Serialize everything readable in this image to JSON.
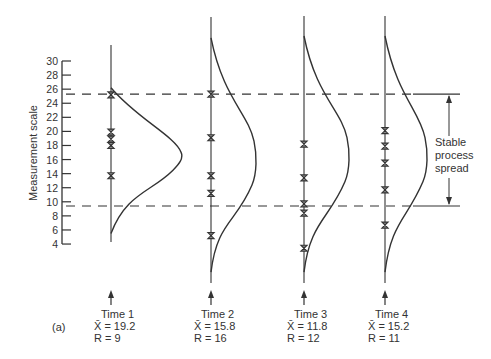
{
  "figure": {
    "panel_label": "(a)",
    "y_axis_title": "Measurement scale",
    "annotation": [
      "Stable",
      "process",
      "spread"
    ],
    "colors": {
      "ink": "#333333",
      "background": "#ffffff"
    }
  },
  "chart_data": {
    "type": "scatter",
    "title": "",
    "xlabel": "",
    "ylabel": "Measurement scale",
    "ylim": [
      4,
      30
    ],
    "yticks": [
      4,
      6,
      8,
      10,
      12,
      14,
      16,
      18,
      20,
      22,
      24,
      26,
      28,
      30
    ],
    "control_limits": {
      "upper": 25.3,
      "lower": 9.4,
      "label": "Stable process spread"
    },
    "categories": [
      "Time 1",
      "Time 2",
      "Time 3",
      "Time 4"
    ],
    "series": [
      {
        "name": "Time 1",
        "xbar_label": "X̄ = 19.2",
        "r_label": "R = 9",
        "xbar": 19.2,
        "range": 9,
        "points": [
          25.2,
          19.9,
          18.9,
          18.0,
          13.7
        ],
        "distribution": {
          "top": 26.2,
          "bottom": 5.5,
          "peak_value": 16.2,
          "peak_width": 70
        }
      },
      {
        "name": "Time 2",
        "xbar_label": "X̄ = 15.8",
        "r_label": "R = 16",
        "xbar": 15.8,
        "range": 16,
        "points": [
          25.3,
          19.1,
          13.7,
          11.2,
          5.2
        ],
        "distribution": {
          "top": 33.3,
          "bottom": 0.0,
          "peak_value": 15.5,
          "peak_width": 45
        }
      },
      {
        "name": "Time 3",
        "xbar_label": "X̄ = 11.8",
        "r_label": "R = 12",
        "xbar": 11.8,
        "range": 12,
        "points": [
          18.2,
          13.4,
          9.7,
          8.4,
          3.4
        ],
        "distribution": {
          "top": 34.0,
          "bottom": 0.0,
          "peak_value": 16.0,
          "peak_width": 45
        }
      },
      {
        "name": "Time 4",
        "xbar_label": "X̄ = 15.2",
        "r_label": "R = 11",
        "xbar": 15.2,
        "range": 11,
        "points": [
          20.1,
          17.9,
          15.5,
          11.7,
          6.7
        ],
        "distribution": {
          "top": 34.0,
          "bottom": 0.0,
          "peak_value": 16.0,
          "peak_width": 42
        }
      }
    ]
  }
}
